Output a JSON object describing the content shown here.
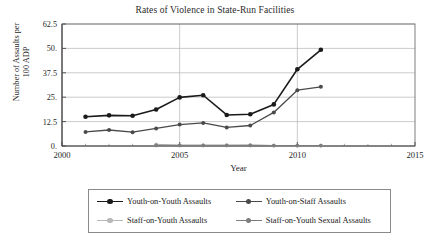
{
  "chart_data": {
    "type": "line",
    "title": "Rates of Violence in State-Run Facilities",
    "xlabel": "Year",
    "ylabel_line1": "Number of Assaults per",
    "ylabel_line2": "100 ADP",
    "xlim": [
      2000,
      2015
    ],
    "ylim": [
      0,
      62.5
    ],
    "xticks": [
      "2000",
      "2005",
      "2010",
      "2015"
    ],
    "xtick_values": [
      2000,
      2005,
      2010,
      2015
    ],
    "yticks": [
      "0.",
      "12.5",
      "25.",
      "37.5",
      "50.",
      "62.5"
    ],
    "ytick_values": [
      0,
      12.5,
      25,
      37.5,
      50,
      62.5
    ],
    "grid": "horizontal-and-vertical-at-xticks",
    "legend_position": "below-plot",
    "x": [
      2001,
      2002,
      2003,
      2004,
      2005,
      2006,
      2007,
      2008,
      2009,
      2010,
      2011
    ],
    "series": [
      {
        "name": "Youth-on-Youth Assaults",
        "color": "#1a1a1a",
        "x": [
          2001,
          2002,
          2003,
          2004,
          2005,
          2006,
          2007,
          2008,
          2009,
          2010,
          2011
        ],
        "values": [
          15.0,
          15.7,
          15.5,
          18.7,
          24.9,
          26.0,
          15.9,
          16.3,
          21.3,
          39.3,
          49.3
        ]
      },
      {
        "name": "Youth-on-Staff Assaults",
        "color": "#4a4a4a",
        "x": [
          2001,
          2002,
          2003,
          2004,
          2005,
          2006,
          2007,
          2008,
          2009,
          2010,
          2011
        ],
        "values": [
          7.2,
          8.2,
          7.1,
          9.0,
          11.0,
          11.8,
          9.5,
          10.5,
          17.2,
          28.6,
          30.3
        ]
      },
      {
        "name": "Staff-on-Youth Assaults",
        "color": "#b8b8b8",
        "x": [
          2004,
          2005,
          2006,
          2007,
          2008,
          2009,
          2010,
          2011
        ],
        "values": [
          0.9,
          0.4,
          0.3,
          0.3,
          0.5,
          0.2,
          0.2,
          0.2
        ]
      },
      {
        "name": "Staff-on-Youth Sexual Assaults",
        "color": "#7d7d7d",
        "x": [
          2004,
          2005,
          2006,
          2007,
          2008,
          2009,
          2010,
          2011
        ],
        "values": [
          0.3,
          0.3,
          0.3,
          0.3,
          0.3,
          0.2,
          0.2,
          0.2
        ]
      }
    ]
  }
}
